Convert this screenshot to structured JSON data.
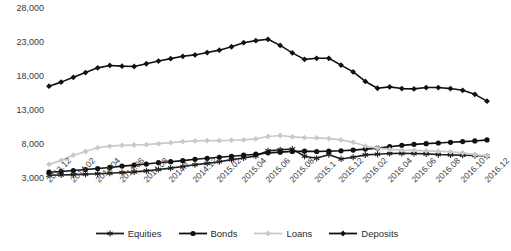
{
  "chart_data": {
    "type": "line",
    "title": "",
    "subtitle": "",
    "xlabel": "",
    "ylabel": "",
    "ylim": [
      3000,
      28000
    ],
    "ytick_values": [
      3000,
      8000,
      13000,
      18000,
      23000,
      28000
    ],
    "ytick_labels": [
      "3,000",
      "8,000",
      "13,000",
      "18,000",
      "23,000",
      "28,000"
    ],
    "grid": false,
    "legend_position": "bottom",
    "x": [
      "2013.12",
      "2014.01",
      "2014.02",
      "2014.03",
      "2014.04",
      "2014.05",
      "2014.06",
      "2014.07",
      "2014.08",
      "2014.09",
      "2014.1",
      "2014.11",
      "2014.12",
      "2015.01",
      "2015.02",
      "2015.03",
      "2015.04",
      "2015.05",
      "2015.06",
      "2015.07",
      "2015.08",
      "2015.09",
      "2015.1",
      "2015.11",
      "2015.12",
      "2016.01",
      "2016.02",
      "2016.03",
      "2016.04",
      "2016.05",
      "2016.06",
      "2016.07",
      "2016.08",
      "2016.09",
      "2016.10",
      "2016.11",
      "2016.12"
    ],
    "xtick_labels": [
      "2013.12",
      "2014.02",
      "2014.04",
      "2014.06",
      "2014.08",
      "2014.1",
      "2014.12",
      "2015.02",
      "2015.04",
      "2015.06",
      "2015.08",
      "2015.1",
      "2015.12",
      "2016.02",
      "2016.04",
      "2016.06",
      "2016.08",
      "2016.10",
      "2016.12"
    ],
    "series": [
      {
        "name": "Equities",
        "color": "#1f1f1f",
        "marker": "asterisk",
        "values": [
          3400,
          3450,
          3500,
          3550,
          3620,
          3700,
          3800,
          3900,
          4050,
          4250,
          4450,
          4700,
          4950,
          5150,
          5400,
          5700,
          5950,
          6250,
          7000,
          7150,
          7250,
          6200,
          5900,
          6450,
          5800,
          6050,
          6400,
          6500,
          6600,
          6620,
          6600,
          6550,
          6450,
          6400,
          6350,
          6300,
          6200
        ]
      },
      {
        "name": "Bonds",
        "color": "#111111",
        "marker": "circle",
        "values": [
          3850,
          3950,
          4100,
          4250,
          4400,
          4550,
          4750,
          4900,
          5050,
          5250,
          5400,
          5550,
          5750,
          5900,
          6050,
          6200,
          6350,
          6500,
          6700,
          6800,
          6900,
          6950,
          6900,
          6950,
          7000,
          7100,
          7250,
          7400,
          7600,
          7800,
          7950,
          8050,
          8150,
          8250,
          8350,
          8450,
          8600
        ]
      },
      {
        "name": "Loans",
        "color": "#c9c9c9",
        "marker": "diamond",
        "values": [
          5000,
          5600,
          6350,
          6900,
          7450,
          7700,
          7800,
          7850,
          7900,
          8050,
          8200,
          8350,
          8450,
          8500,
          8500,
          8550,
          8600,
          8750,
          9100,
          9250,
          9050,
          8950,
          8900,
          8800,
          8600,
          8250,
          7700,
          7400,
          7200,
          7100,
          7050,
          7000,
          6950,
          6850,
          6700,
          6450,
          6250
        ]
      },
      {
        "name": "Deposits",
        "color": "#111111",
        "marker": "diamond",
        "values": [
          16500,
          17100,
          17800,
          18500,
          19200,
          19550,
          19450,
          19400,
          19800,
          20200,
          20550,
          20900,
          21100,
          21450,
          21800,
          22300,
          22900,
          23200,
          23400,
          22500,
          21400,
          20450,
          20600,
          20600,
          19600,
          18600,
          17200,
          16200,
          16400,
          16150,
          16100,
          16300,
          16300,
          16150,
          15900,
          15300,
          14300
        ]
      }
    ]
  },
  "legend": {
    "items": [
      {
        "label": "Equities"
      },
      {
        "label": "Bonds"
      },
      {
        "label": "Loans"
      },
      {
        "label": "Deposits"
      }
    ]
  }
}
